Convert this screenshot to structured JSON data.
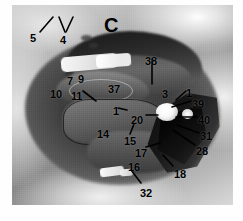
{
  "figure": {
    "panel_label": "C",
    "kind": "anatomical-dissection-photograph",
    "palette": {
      "ink": "#000000",
      "plate_light": "#d6d6d6",
      "plate_mid": "#8a8a8a",
      "plate_dark": "#1d1d1d",
      "page_background": "#ffffff"
    },
    "plate": {
      "x": 12,
      "y": 5,
      "width": 221,
      "height": 200
    }
  },
  "annotations": [
    {
      "id": "label-5",
      "text": "5",
      "x": 30,
      "y": 33,
      "leader": {
        "x1": 40,
        "y1": 32,
        "x2": 53,
        "y2": 17
      }
    },
    {
      "id": "label-4",
      "text": "4",
      "x": 60,
      "y": 35,
      "leader": {
        "x1": 65,
        "y1": 32,
        "x2": 59,
        "y2": 17
      },
      "leader2": {
        "x1": 66,
        "y1": 32,
        "x2": 73,
        "y2": 17
      }
    },
    {
      "id": "label-38",
      "text": "38",
      "x": 145,
      "y": 56,
      "leader": {
        "x1": 152,
        "y1": 59,
        "x2": 152,
        "y2": 84
      }
    },
    {
      "id": "label-7",
      "text": "7",
      "x": 67,
      "y": 76,
      "leader": null
    },
    {
      "id": "label-9",
      "text": "9",
      "x": 78,
      "y": 74,
      "leader": null
    },
    {
      "id": "label-10",
      "text": "10",
      "x": 50,
      "y": 89,
      "leader": null
    },
    {
      "id": "label-11",
      "text": "11",
      "x": 71,
      "y": 91,
      "leader": {
        "x1": 83,
        "y1": 91,
        "x2": 96,
        "y2": 101
      }
    },
    {
      "id": "label-37",
      "text": "37",
      "x": 108,
      "y": 84,
      "leader": null
    },
    {
      "id": "label-3",
      "text": "3",
      "x": 162,
      "y": 89,
      "leader": null
    },
    {
      "id": "label-1",
      "text": "1",
      "x": 186,
      "y": 88,
      "leader": {
        "x1": 186,
        "y1": 91,
        "x2": 176,
        "y2": 100
      }
    },
    {
      "id": "label-39",
      "text": "39",
      "x": 192,
      "y": 99,
      "leader": {
        "x1": 191,
        "y1": 101,
        "x2": 172,
        "y2": 107
      }
    },
    {
      "id": "label-13",
      "text": "1",
      "x": 113,
      "y": 106,
      "leader": {
        "x1": 118,
        "y1": 108,
        "x2": 127,
        "y2": 110
      }
    },
    {
      "id": "label-20",
      "text": "20",
      "x": 131,
      "y": 115,
      "leader": {
        "x1": 146,
        "y1": 115,
        "x2": 158,
        "y2": 115
      }
    },
    {
      "id": "label-40",
      "text": "40",
      "x": 198,
      "y": 115,
      "leader": {
        "x1": 197,
        "y1": 117,
        "x2": 176,
        "y2": 117
      }
    },
    {
      "id": "label-31",
      "text": "31",
      "x": 200,
      "y": 131,
      "leader": {
        "x1": 199,
        "y1": 133,
        "x2": 177,
        "y2": 125
      }
    },
    {
      "id": "label-28",
      "text": "28",
      "x": 196,
      "y": 146,
      "leader": {
        "x1": 195,
        "y1": 145,
        "x2": 173,
        "y2": 130
      }
    },
    {
      "id": "label-14",
      "text": "14",
      "x": 97,
      "y": 129,
      "leader": null
    },
    {
      "id": "label-15",
      "text": "15",
      "x": 124,
      "y": 136,
      "leader": {
        "x1": 130,
        "y1": 134,
        "x2": 134,
        "y2": 124
      }
    },
    {
      "id": "label-17",
      "text": "17",
      "x": 135,
      "y": 148,
      "leader": {
        "x1": 146,
        "y1": 147,
        "x2": 160,
        "y2": 143
      }
    },
    {
      "id": "label-16",
      "text": "16",
      "x": 128,
      "y": 162,
      "leader": null
    },
    {
      "id": "label-18",
      "text": "18",
      "x": 174,
      "y": 169,
      "leader": {
        "x1": 173,
        "y1": 166,
        "x2": 163,
        "y2": 155
      }
    },
    {
      "id": "label-32",
      "text": "32",
      "x": 140,
      "y": 188,
      "leader": {
        "x1": 141,
        "y1": 183,
        "x2": 131,
        "y2": 170
      }
    }
  ]
}
